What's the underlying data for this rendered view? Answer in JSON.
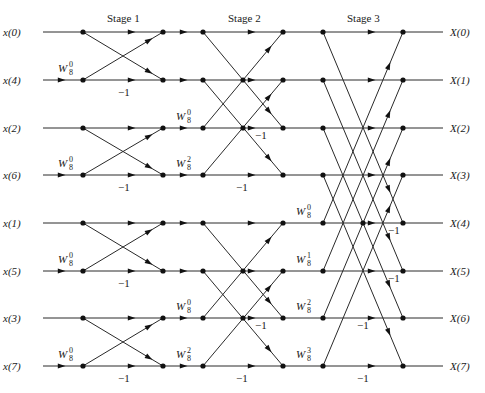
{
  "stage_labels": [
    {
      "text": "Stage 1",
      "x": 107,
      "y": 22
    },
    {
      "text": "Stage 2",
      "x": 228,
      "y": 22
    },
    {
      "text": "Stage 3",
      "x": 347,
      "y": 22
    }
  ],
  "rows_y": [
    32,
    80,
    128,
    175,
    223,
    271,
    318,
    366
  ],
  "columns_x": {
    "input_start": 43,
    "c0": 83,
    "c1": 163,
    "c2": 203,
    "c3": 283,
    "c4": 323,
    "c5": 403,
    "output_end": 443
  },
  "inputs": [
    "x(0)",
    "x(4)",
    "x(2)",
    "x(6)",
    "x(1)",
    "x(5)",
    "x(3)",
    "x(7)"
  ],
  "outputs": [
    "X(0)",
    "X(1)",
    "X(2)",
    "X(3)",
    "X(4)",
    "X(5)",
    "X(6)",
    "X(7)"
  ],
  "twiddles": [
    {
      "base": "W",
      "sub": "8",
      "sup": "0",
      "x": 58,
      "y": 72
    },
    {
      "base": "W",
      "sub": "8",
      "sup": "0",
      "x": 58,
      "y": 167
    },
    {
      "base": "W",
      "sub": "8",
      "sup": "0",
      "x": 58,
      "y": 263
    },
    {
      "base": "W",
      "sub": "8",
      "sup": "0",
      "x": 58,
      "y": 358
    },
    {
      "base": "W",
      "sub": "8",
      "sup": "0",
      "x": 176,
      "y": 120
    },
    {
      "base": "W",
      "sub": "8",
      "sup": "2",
      "x": 176,
      "y": 167
    },
    {
      "base": "W",
      "sub": "8",
      "sup": "0",
      "x": 176,
      "y": 310
    },
    {
      "base": "W",
      "sub": "8",
      "sup": "2",
      "x": 176,
      "y": 358
    },
    {
      "base": "W",
      "sub": "8",
      "sup": "0",
      "x": 296,
      "y": 215
    },
    {
      "base": "W",
      "sub": "8",
      "sup": "1",
      "x": 296,
      "y": 263
    },
    {
      "base": "W",
      "sub": "8",
      "sup": "2",
      "x": 296,
      "y": 310
    },
    {
      "base": "W",
      "sub": "8",
      "sup": "3",
      "x": 296,
      "y": 358
    }
  ],
  "minus_one_labels": [
    {
      "text": "−1",
      "x": 118,
      "y": 96
    },
    {
      "text": "−1",
      "x": 118,
      "y": 191
    },
    {
      "text": "−1",
      "x": 118,
      "y": 287
    },
    {
      "text": "−1",
      "x": 118,
      "y": 382
    },
    {
      "text": "−1",
      "x": 255,
      "y": 139
    },
    {
      "text": "−1",
      "x": 236,
      "y": 191
    },
    {
      "text": "−1",
      "x": 255,
      "y": 329
    },
    {
      "text": "−1",
      "x": 236,
      "y": 382
    },
    {
      "text": "−1",
      "x": 388,
      "y": 234
    },
    {
      "text": "−1",
      "x": 388,
      "y": 282
    },
    {
      "text": "−1",
      "x": 357,
      "y": 329
    },
    {
      "text": "−1",
      "x": 357,
      "y": 382
    }
  ],
  "stages": [
    {
      "name": "Stage 1",
      "from_col": "c0",
      "to_col": "c1",
      "span": 1,
      "block": 2
    },
    {
      "name": "Stage 2",
      "from_col": "c2",
      "to_col": "c3",
      "span": 2,
      "block": 4
    },
    {
      "name": "Stage 3",
      "from_col": "c4",
      "to_col": "c5",
      "span": 4,
      "block": 8
    }
  ],
  "crossing_dots": [
    {
      "x": 243,
      "row": 1
    },
    {
      "x": 243,
      "row": 2
    },
    {
      "x": 243,
      "row": 5
    },
    {
      "x": 243,
      "row": 6
    },
    {
      "x": 363,
      "row": 4
    }
  ]
}
